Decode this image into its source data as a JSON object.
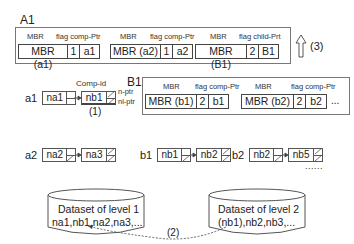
{
  "labels": {
    "A1": "A1",
    "B1": "B1",
    "a1": "a1",
    "a2": "a2",
    "b1": "b1",
    "b2": "b2",
    "comp_id": "Comp-id",
    "n_ptr": "n-ptr",
    "nl_ptr": "nl-ptr",
    "step1": "(1)",
    "step2": "(2)",
    "step3": "(3)",
    "ellipsis_dots": "......"
  },
  "A1": {
    "entries": [
      {
        "header_mbr": "MBR",
        "header_rest": "flag comp-Ptr",
        "mbr": "MBR (a1)",
        "flag": "1",
        "ptr": "a1"
      },
      {
        "header_mbr": "MBR",
        "header_rest": "flag comp-Ptr",
        "mbr": "MBR (a2)",
        "flag": "1",
        "ptr": "a2"
      },
      {
        "header_mbr": "MBR",
        "header_rest": "flag child-Prt",
        "mbr": "MBR (B1)",
        "flag": "2",
        "ptr": "B1"
      }
    ]
  },
  "B1": {
    "entries": [
      {
        "header_mbr": "MBR",
        "header_rest": "flag comp-Ptr",
        "mbr": "MBR (b1)",
        "flag": "2",
        "ptr": "b1"
      },
      {
        "header_mbr": "MBR",
        "header_rest": "flag comp-Ptr",
        "mbr": "MBR (b2)",
        "flag": "2",
        "ptr": "b2"
      }
    ],
    "more": "..."
  },
  "lists": {
    "a1": [
      "na1",
      "nb1"
    ],
    "a2": [
      "na2",
      "na3"
    ],
    "b1": [
      "nb1",
      "nb2"
    ],
    "b2": [
      "nb2",
      "nb5"
    ]
  },
  "datasets": {
    "level1": {
      "title": "Dataset of level 1",
      "items": "na1,nb1,na2,na3,..."
    },
    "level2": {
      "title": "Dataset of level 2",
      "items": "(nb1),nb2,nb3,..."
    }
  }
}
